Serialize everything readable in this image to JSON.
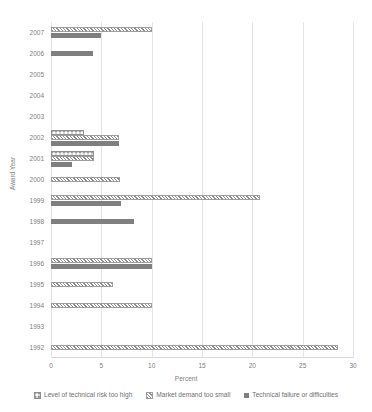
{
  "chart": {
    "type": "bar",
    "title": "",
    "xlabel": "Percent",
    "ylabel": "Award Year"
  },
  "axes": {
    "x_ticks": [
      "0",
      "5",
      "10",
      "15",
      "20",
      "25",
      "30"
    ],
    "y_ticks": [
      "2007",
      "2006",
      "2005",
      "2004",
      "2003",
      "2002",
      "2001",
      "2000",
      "1999",
      "1998",
      "1997",
      "1996",
      "1995",
      "1994",
      "1993",
      "1992"
    ]
  },
  "legend": {
    "items": [
      {
        "label": "Level of technical risk too high",
        "marker": "dotted-weave-swatch",
        "color": "#9a9a9a"
      },
      {
        "label": "Market demand too small",
        "marker": "diagonal-hatch-swatch",
        "color": "#9d9d9d"
      },
      {
        "label": "Technical failure or difficulties",
        "marker": "solid-gray-swatch",
        "color": "#7f7f7f"
      }
    ]
  },
  "chart_data": {
    "type": "bar",
    "orientation": "horizontal",
    "title": "",
    "xlabel": "Percent",
    "ylabel": "Award Year",
    "xlim": [
      0,
      30
    ],
    "grid": true,
    "legend_position": "bottom",
    "categories": [
      "2007",
      "2006",
      "2005",
      "2004",
      "2003",
      "2002",
      "2001",
      "2000",
      "1999",
      "1998",
      "1997",
      "1996",
      "1995",
      "1994",
      "1993",
      "1992"
    ],
    "series": [
      {
        "name": "Level of technical risk too high",
        "values": [
          0,
          0,
          0,
          0,
          0,
          3.3,
          4.3,
          0,
          0,
          0,
          0,
          0,
          0,
          0,
          0,
          0
        ]
      },
      {
        "name": "Market demand too small",
        "values": [
          10.0,
          0,
          0,
          0,
          0,
          6.8,
          4.3,
          6.9,
          20.8,
          0,
          0,
          10.0,
          6.2,
          10.0,
          0,
          28.5
        ]
      },
      {
        "name": "Technical failure or difficulties",
        "values": [
          5.0,
          4.2,
          0,
          0,
          0,
          6.8,
          2.1,
          0,
          7.0,
          8.2,
          0,
          10.0,
          0,
          0,
          0,
          0
        ]
      }
    ]
  }
}
